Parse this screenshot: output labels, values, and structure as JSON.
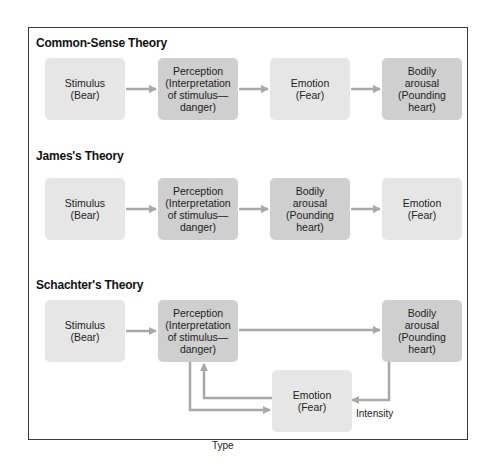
{
  "colors": {
    "frame_border": "#3a3a3a",
    "box_light": "#e6e6e6",
    "box_dark": "#cfcfcf",
    "arrow": "#a8a8a8"
  },
  "theories": [
    {
      "title": "Common-Sense Theory",
      "boxes": [
        {
          "label": "Stimulus\n(Bear)",
          "shade": "light"
        },
        {
          "label": "Perception\n(Interpretation\nof stimulus—\ndanger)",
          "shade": "dark"
        },
        {
          "label": "Emotion\n(Fear)",
          "shade": "light"
        },
        {
          "label": "Bodily\narousal\n(Pounding\nheart)",
          "shade": "dark"
        }
      ]
    },
    {
      "title": "James's Theory",
      "boxes": [
        {
          "label": "Stimulus\n(Bear)",
          "shade": "light"
        },
        {
          "label": "Perception\n(Interpretation\nof stimulus—\ndanger)",
          "shade": "dark"
        },
        {
          "label": "Bodily\narousal\n(Pounding\nheart)",
          "shade": "dark"
        },
        {
          "label": "Emotion\n(Fear)",
          "shade": "light"
        }
      ]
    },
    {
      "title": "Schachter's Theory",
      "boxes": [
        {
          "label": "Stimulus\n(Bear)",
          "shade": "light"
        },
        {
          "label": "Perception\n(Interpretation\nof stimulus—\ndanger)",
          "shade": "dark"
        },
        {
          "label": "Bodily\narousal\n(Pounding\nheart)",
          "shade": "dark"
        },
        {
          "label": "Emotion\n(Fear)",
          "shade": "light"
        }
      ],
      "edge_labels": {
        "type": "Type",
        "intensity": "Intensity"
      }
    }
  ]
}
